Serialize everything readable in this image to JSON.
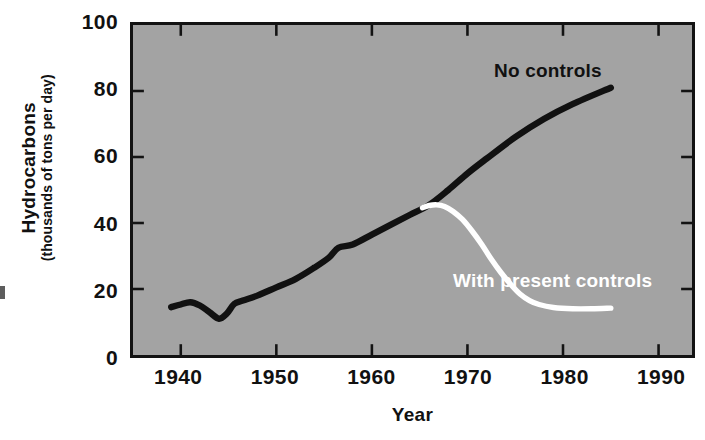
{
  "chart_data": {
    "type": "line",
    "title": "",
    "subtitle": "",
    "xlabel": "Year",
    "ylabel": "Hydrocarbons",
    "ylabel_sub": "(thousands of tons per day)",
    "xlim": [
      1935,
      1993.5
    ],
    "ylim": [
      0,
      100
    ],
    "xticks": [
      1940,
      1950,
      1960,
      1970,
      1980,
      1990
    ],
    "xticklabels": [
      "1940",
      "1950",
      "1960",
      "1970",
      "1980",
      "1990"
    ],
    "yticks": [
      0,
      20,
      40,
      60,
      80,
      100
    ],
    "yticklabels": [
      "0",
      "20",
      "40",
      "60",
      "80",
      "100"
    ],
    "grid": false,
    "legend_position": "inline-annotation",
    "plot_background": "#a3a3a3",
    "figure_background": "#ffffff",
    "series": [
      {
        "name": "No controls",
        "color": "#111111",
        "label_color": "#111111",
        "x": [
          1939.0,
          1940.0,
          1941.0,
          1942.0,
          1943.0,
          1944.0,
          1944.8,
          1945.6,
          1946.5,
          1948.0,
          1950.0,
          1952.0,
          1954.0,
          1955.5,
          1956.5,
          1958.0,
          1960.0,
          1962.0,
          1964.0,
          1966.0,
          1968.0,
          1970.0,
          1972.0,
          1975.0,
          1978.0,
          1981.0,
          1985.0
        ],
        "y": [
          14.5,
          15.3,
          16.0,
          15.0,
          13.0,
          11.0,
          12.5,
          15.5,
          16.5,
          18.0,
          20.5,
          23.0,
          26.5,
          29.5,
          32.5,
          33.5,
          36.5,
          39.5,
          42.5,
          45.5,
          50.0,
          55.0,
          59.5,
          66.0,
          71.5,
          76.0,
          81.0
        ]
      },
      {
        "name": "With present controls",
        "color": "#ffffff",
        "label_color": "#ffffff",
        "x": [
          1965.3,
          1966.0,
          1966.8,
          1967.6,
          1968.5,
          1969.5,
          1970.5,
          1971.5,
          1972.5,
          1973.5,
          1974.5,
          1975.5,
          1976.5,
          1977.5,
          1979.0,
          1981.0,
          1983.0,
          1985.0
        ],
        "y": [
          44.6,
          45.3,
          45.5,
          45.0,
          43.5,
          41.0,
          37.5,
          33.5,
          29.0,
          25.0,
          21.5,
          18.5,
          16.5,
          15.3,
          14.4,
          14.0,
          14.0,
          14.2
        ]
      }
    ],
    "annotations": [
      {
        "text": "No controls",
        "color": "#111111"
      },
      {
        "text": "With present controls",
        "color": "#ffffff"
      }
    ]
  },
  "axis": {
    "y_title_main": "Hydrocarbons",
    "y_title_sub": "(thousands of tons per day)",
    "x_title": "Year"
  },
  "ytick_labels": [
    "100",
    "80",
    "60",
    "40",
    "20",
    "0"
  ],
  "xtick_labels": [
    "1940",
    "1950",
    "1960",
    "1970",
    "1980",
    "1990"
  ],
  "annotations": {
    "no_controls": "No controls",
    "with_present_controls": "With present controls"
  },
  "colors": {
    "plot_background": "#a3a3a3",
    "axis": "#131313",
    "series_no_controls": "#111111",
    "series_with_controls": "#ffffff",
    "text": "#111111"
  }
}
